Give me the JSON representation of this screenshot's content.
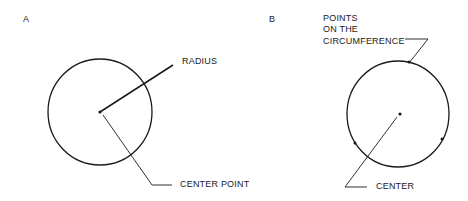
{
  "panels": {
    "a": {
      "letter": "A",
      "labels": {
        "radius": "RADIUS",
        "center_point": "CENTER POINT"
      }
    },
    "b": {
      "letter": "B",
      "labels": {
        "points_line1": "POINTS",
        "points_line2": "ON THE",
        "points_line3": "CIRCUMFERENCE",
        "center": "CENTER"
      }
    }
  },
  "colors": {
    "stroke": "#1a1a1a",
    "background": "#ffffff"
  }
}
